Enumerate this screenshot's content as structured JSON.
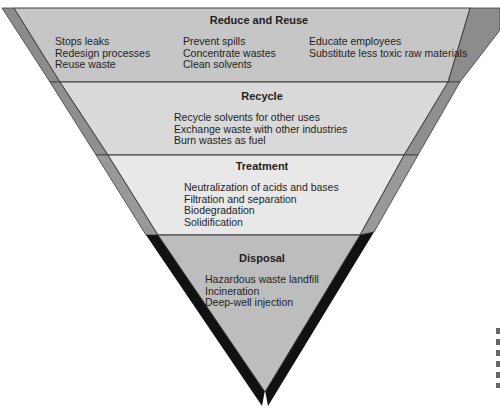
{
  "diagram": {
    "type": "inverted-pyramid",
    "tiers": [
      {
        "title": "Reduce and Reuse",
        "color": "#c6c6c6",
        "columns": [
          [
            "Stops leaks",
            "Redesign processes",
            "Reuse waste"
          ],
          [
            "Prevent spills",
            "Concentrate wastes",
            "Clean solvents"
          ],
          [
            "Educate employees",
            "Substitute less toxic raw materials"
          ]
        ]
      },
      {
        "title": "Recycle",
        "color": "#d9d9d9",
        "items": [
          "Recycle solvents for other uses",
          "Exchange waste with other industries",
          "Burn wastes as fuel"
        ]
      },
      {
        "title": "Treatment",
        "color": "#e8e8e8",
        "items": [
          "Neutralization of acids and bases",
          "Filtration and separation",
          "Biodegradation",
          "Solidification"
        ]
      },
      {
        "title": "Disposal",
        "color": "#bdbdbd",
        "items": [
          "Hazardous waste landfill",
          "Incineration",
          "Deep-well injection"
        ]
      }
    ]
  }
}
